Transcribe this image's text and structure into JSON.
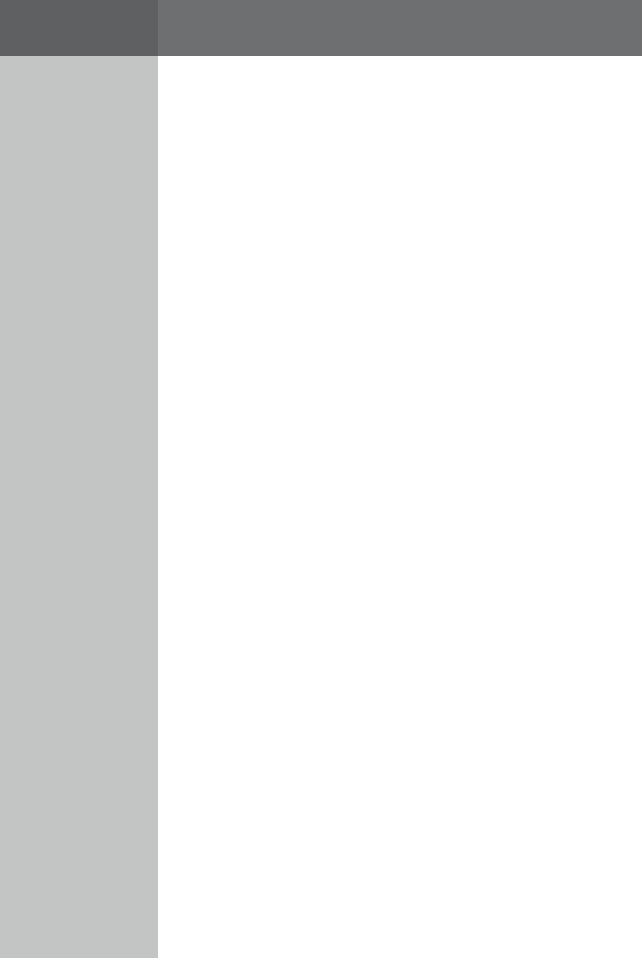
{
  "window": {
    "state": "blank",
    "width": 642,
    "height": 958
  },
  "colors": {
    "titlebar_left": "#5e6061",
    "titlebar_right": "#6d6f70",
    "sidebar": "#c3c5c5",
    "content": "#ffffff"
  },
  "titlebar": {
    "left_segment": {
      "width": 158,
      "label": ""
    },
    "right_segment": {
      "label": ""
    }
  },
  "sidebar": {
    "width": 158,
    "items": []
  },
  "content": {
    "text": ""
  }
}
